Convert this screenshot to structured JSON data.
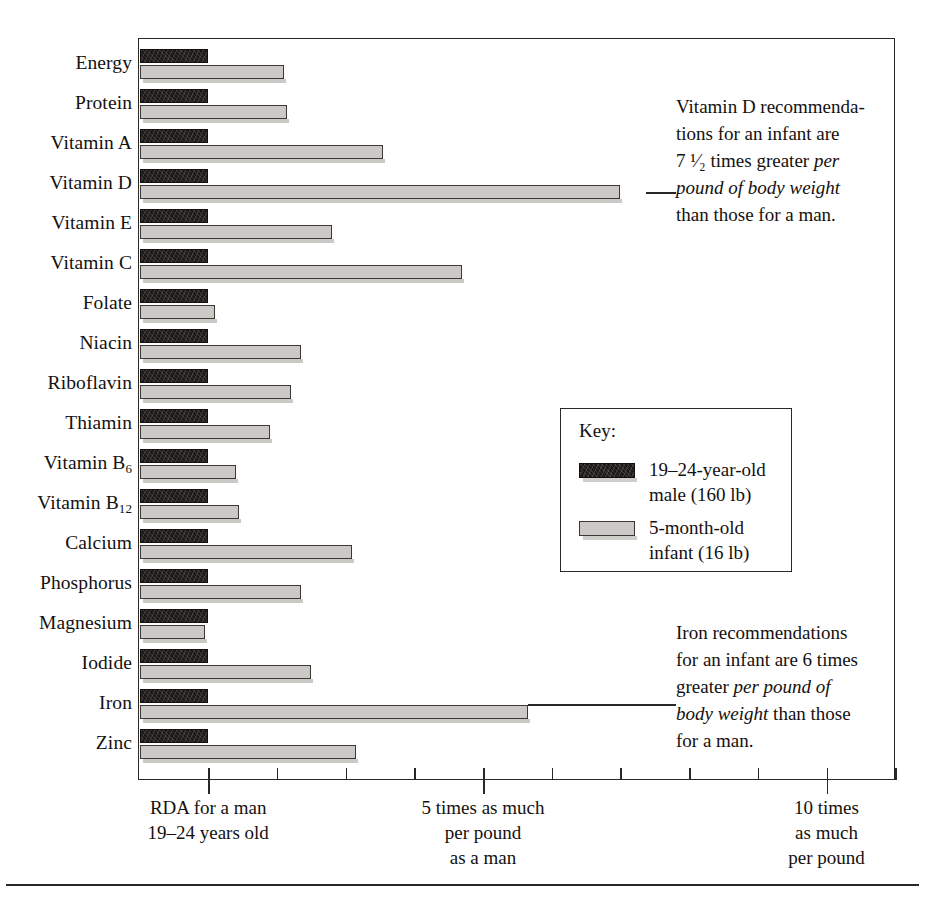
{
  "chart_data": {
    "type": "bar",
    "title": "",
    "subtitle": "",
    "xlabel": "",
    "ylabel": "",
    "orientation": "horizontal",
    "grid": false,
    "xlim": [
      0,
      11.0
    ],
    "baseline_value": 1,
    "categories": [
      "Energy",
      "Protein",
      "Vitamin A",
      "Vitamin D",
      "Vitamin E",
      "Vitamin C",
      "Folate",
      "Niacin",
      "Riboflavin",
      "Thiamin",
      "Vitamin B6",
      "Vitamin B12",
      "Calcium",
      "Phosphorus",
      "Magnesium",
      "Iodide",
      "Iron",
      "Zinc"
    ],
    "category_labels_html": [
      "Energy",
      "Protein",
      "Vitamin A",
      "Vitamin D",
      "Vitamin E",
      "Vitamin C",
      "Folate",
      "Niacin",
      "Riboflavin",
      "Thiamin",
      "Vitamin B<sub>6</sub>",
      "Vitamin B<sub>12</sub>",
      "Calcium",
      "Phosphorus",
      "Magnesium",
      "Iodide",
      "Iron",
      "Zinc"
    ],
    "series": [
      {
        "name": "19–24-year-old male (160 lb)",
        "key": "male",
        "color": "#1c1815",
        "values": [
          1,
          1,
          1,
          1,
          1,
          1,
          1,
          1,
          1,
          1,
          1,
          1,
          1,
          1,
          1,
          1,
          1,
          1
        ]
      },
      {
        "name": "5-month-old infant (16 lb)",
        "key": "infant",
        "color": "#cbc9c6",
        "values": [
          2.1,
          2.15,
          3.55,
          7.0,
          2.8,
          4.7,
          1.1,
          2.35,
          2.2,
          1.9,
          1.4,
          1.45,
          3.1,
          2.35,
          0.95,
          2.5,
          5.65,
          3.15
        ]
      }
    ],
    "x_ticks": [
      1,
      2,
      3,
      4,
      5,
      6,
      7,
      8,
      9,
      10,
      11
    ],
    "x_major_ticks": [
      1,
      5,
      10
    ],
    "x_tick_captions": [
      {
        "value": 1,
        "lines": [
          "RDA for a man",
          "19–24 years old"
        ]
      },
      {
        "value": 5,
        "lines": [
          "5 times as much",
          "per pound",
          "as a man"
        ]
      },
      {
        "value": 10,
        "lines": [
          "10 times",
          "as much",
          "per pound"
        ]
      }
    ],
    "annotations": [
      {
        "id": "vitamin-d-note",
        "target": "Vitamin D",
        "lines": [
          {
            "parts": [
              {
                "text": "Vitamin D recommenda-",
                "italic": false
              }
            ]
          },
          {
            "parts": [
              {
                "text": "tions for an infant are",
                "italic": false
              }
            ]
          },
          {
            "parts": [
              {
                "text": "7 ¹⁄₂ times greater ",
                "italic": false
              },
              {
                "text": "per",
                "italic": true
              }
            ]
          },
          {
            "parts": [
              {
                "text": "pound of body weight",
                "italic": true
              }
            ]
          },
          {
            "parts": [
              {
                "text": "than those for a man.",
                "italic": false
              }
            ]
          }
        ]
      },
      {
        "id": "iron-note",
        "target": "Iron",
        "lines": [
          {
            "parts": [
              {
                "text": "Iron recommendations",
                "italic": false
              }
            ]
          },
          {
            "parts": [
              {
                "text": "for an infant are 6 times",
                "italic": false
              }
            ]
          },
          {
            "parts": [
              {
                "text": "greater ",
                "italic": false
              },
              {
                "text": "per pound of",
                "italic": true
              }
            ]
          },
          {
            "parts": [
              {
                "text": "body weight",
                "italic": true
              },
              {
                "text": " than those",
                "italic": false
              }
            ]
          },
          {
            "parts": [
              {
                "text": "for a man.",
                "italic": false
              }
            ]
          }
        ]
      }
    ]
  },
  "key": {
    "title": "Key:",
    "entries": [
      {
        "swatch": "male",
        "line1": "19–24-year-old",
        "line2": "male (160 lb)"
      },
      {
        "swatch": "infant",
        "line1": "5-month-old",
        "line2": "infant (16 lb)"
      }
    ]
  },
  "colors": {
    "ink": "#14110f",
    "male_bar": "#1c1815",
    "infant_bar": "#cbc9c6",
    "frame": "#2b2724",
    "page": "#ffffff"
  }
}
